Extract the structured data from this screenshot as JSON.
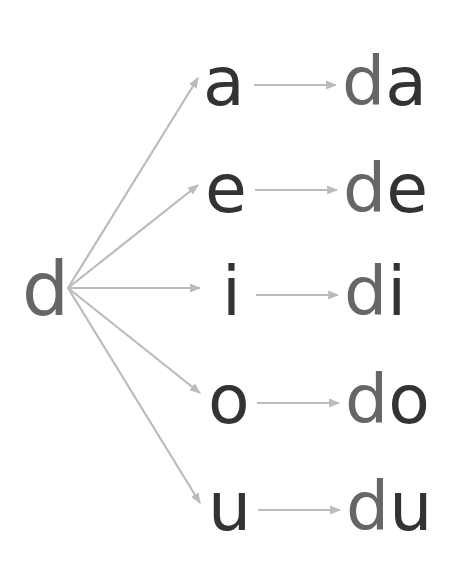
{
  "diagram": {
    "source": {
      "letter": "d",
      "color": "#666666"
    },
    "vowel_color": "#333333",
    "arrow_color": "#bbbbbb",
    "rows": [
      {
        "vowel": "a",
        "result": "da"
      },
      {
        "vowel": "e",
        "result": "de"
      },
      {
        "vowel": "i",
        "result": "di"
      },
      {
        "vowel": "o",
        "result": "do"
      },
      {
        "vowel": "u",
        "result": "du"
      }
    ]
  }
}
